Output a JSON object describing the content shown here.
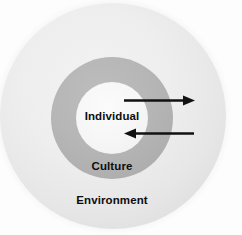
{
  "diagram": {
    "type": "concentric-circles",
    "background_color": "#fdfdfd",
    "layers": [
      {
        "id": "environment",
        "label": "Environment",
        "role": "outermost-circle",
        "fill_color": "#e9e9e9",
        "label_color": "#0d0d0d"
      },
      {
        "id": "culture",
        "label": "Culture",
        "role": "middle-ring",
        "fill_color": "#b3b3b3",
        "label_color": "#0d0d0d"
      },
      {
        "id": "individual",
        "label": "Individual",
        "role": "inner-circle",
        "fill_color": "#f7f7f7",
        "label_color": "#0d0d0d"
      }
    ],
    "arrows": [
      {
        "id": "inward-arrow",
        "icon": "arrow-right-icon",
        "direction": "right",
        "description": "Arrow pointing inward toward the Individual",
        "color": "#111111"
      },
      {
        "id": "outward-arrow",
        "icon": "arrow-left-icon",
        "direction": "left",
        "description": "Arrow pointing outward from the Individual",
        "color": "#111111"
      }
    ]
  }
}
